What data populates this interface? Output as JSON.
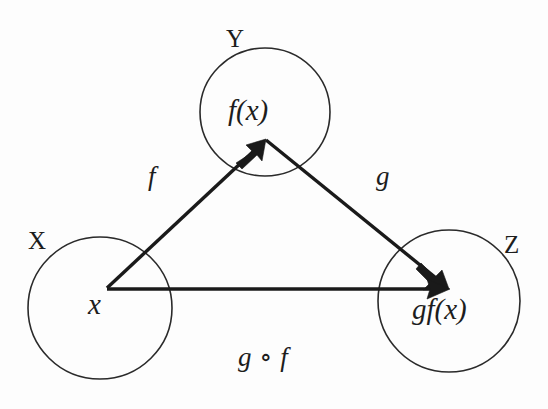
{
  "diagram": {
    "background_color": "#fdfdfd",
    "stroke_color": "#2a2a2a",
    "arrow_color": "#1a1a1a",
    "sets": [
      {
        "id": "domain",
        "name": "X",
        "element": "x",
        "name_x": 28,
        "name_y": 228,
        "element_x": 88,
        "element_y": 290,
        "cx": 100,
        "cy": 308,
        "rx": 72,
        "ry": 71
      },
      {
        "id": "codomain",
        "name": "Y",
        "element": "f(x)",
        "name_x": 226,
        "name_y": 26,
        "element_x": 228,
        "element_y": 96,
        "cx": 265,
        "cy": 112,
        "rx": 65,
        "ry": 64
      },
      {
        "id": "target",
        "name": "Z",
        "element": "gf(x)",
        "name_x": 504,
        "name_y": 232,
        "element_x": 412,
        "element_y": 295,
        "cx": 449,
        "cy": 301,
        "rx": 71,
        "ry": 71
      }
    ],
    "arrows": [
      {
        "id": "f-map",
        "label": "f",
        "label_x": 148,
        "label_y": 163,
        "x1": 107,
        "y1": 288,
        "x2": 265,
        "y2": 140
      },
      {
        "id": "g-map",
        "label": "g",
        "label_x": 376,
        "label_y": 163,
        "x1": 265,
        "y1": 140,
        "x2": 448,
        "y2": 288
      },
      {
        "id": "composition-map",
        "label": "",
        "label_x": 0,
        "label_y": 0,
        "x1": 107,
        "y1": 289,
        "x2": 448,
        "y2": 289
      }
    ],
    "composition": {
      "label": "g ∘ f",
      "x": 238,
      "y": 344
    }
  }
}
